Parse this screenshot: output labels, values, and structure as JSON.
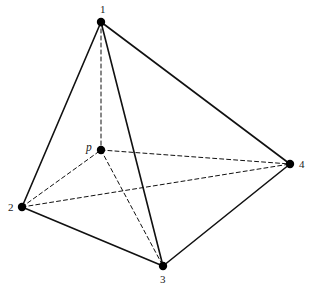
{
  "figure": {
    "name": "tetrahedron-with-interior-point",
    "width": 309,
    "height": 294,
    "background_color": "#ffffff",
    "stroke_color": "#111111",
    "node_fill_color": "#000000",
    "solid_stroke_width": 1.6,
    "dashed_stroke_width": 1.0,
    "dash_pattern": "4,3",
    "node_radius": 4.2
  },
  "nodes": [
    {
      "id": "1",
      "label": "1",
      "x": 101,
      "y": 22,
      "label_x": 100,
      "label_y": 4,
      "italic": false
    },
    {
      "id": "2",
      "label": "2",
      "x": 22,
      "y": 207,
      "label_x": 8,
      "label_y": 202,
      "italic": false
    },
    {
      "id": "3",
      "label": "3",
      "x": 163,
      "y": 266,
      "label_x": 160,
      "label_y": 274,
      "italic": false
    },
    {
      "id": "4",
      "label": "4",
      "x": 290,
      "y": 164,
      "label_x": 299,
      "label_y": 159,
      "italic": false
    },
    {
      "id": "p",
      "label": "p",
      "x": 101,
      "y": 150,
      "label_x": 86,
      "label_y": 142,
      "italic": true
    }
  ],
  "edges": [
    {
      "from": "1",
      "to": "2",
      "style": "solid",
      "name": "edge-1-2"
    },
    {
      "from": "1",
      "to": "3",
      "style": "solid",
      "name": "edge-1-3"
    },
    {
      "from": "1",
      "to": "4",
      "style": "solid",
      "name": "edge-1-4"
    },
    {
      "from": "2",
      "to": "3",
      "style": "solid",
      "name": "edge-2-3"
    },
    {
      "from": "3",
      "to": "4",
      "style": "solid",
      "name": "edge-3-4"
    },
    {
      "from": "1",
      "to": "p",
      "style": "dashed",
      "name": "edge-1-p"
    },
    {
      "from": "2",
      "to": "p",
      "style": "dashed",
      "name": "edge-2-p"
    },
    {
      "from": "2",
      "to": "4",
      "style": "dashed",
      "name": "edge-2-4"
    },
    {
      "from": "p",
      "to": "4",
      "style": "dashed",
      "name": "edge-p-4"
    },
    {
      "from": "p",
      "to": "3",
      "style": "dashed",
      "name": "edge-p-3"
    }
  ]
}
